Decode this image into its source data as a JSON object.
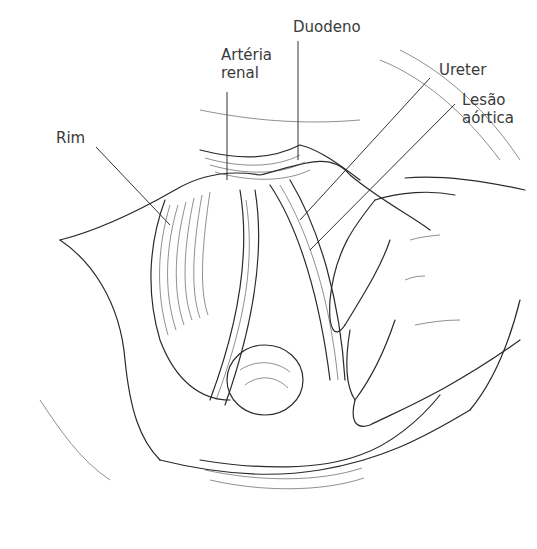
{
  "figure": {
    "labels": {
      "duodeno": "Duodeno",
      "arteria_renal": "Artéria\nrenal",
      "ureter": "Ureter",
      "lesao_aortica": "Lesão\naórtica",
      "rim": "Rim"
    },
    "colors": {
      "ink": "#2a2a2a",
      "text": "#3a3a3a",
      "background": "#ffffff"
    }
  }
}
